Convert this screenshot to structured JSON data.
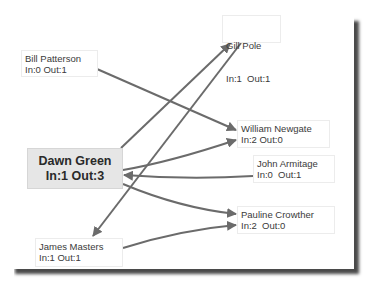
{
  "diagram": {
    "type": "directed-graph",
    "edge_color": "#6b6b6b",
    "focus_fill": "#e6e6e6",
    "nodes": [
      {
        "id": "bill",
        "name": "Bill Patterson",
        "stats": "In:0 Out:1"
      },
      {
        "id": "gill",
        "name": "Gill Pole",
        "stats": "In:1  Out:1"
      },
      {
        "id": "william",
        "name": "William Newgate",
        "stats": "In:2 Out:0"
      },
      {
        "id": "dawn",
        "name": "Dawn Green",
        "stats": "In:1 Out:3",
        "focus": true
      },
      {
        "id": "john",
        "name": "John Armitage",
        "stats": "In:0  Out:1"
      },
      {
        "id": "pauline",
        "name": "Pauline Crowther",
        "stats": "In:2  Out:0"
      },
      {
        "id": "james",
        "name": "James Masters",
        "stats": "In:1 Out:1"
      }
    ],
    "edges": [
      {
        "from": "dawn",
        "to": "gill"
      },
      {
        "from": "gill",
        "to": "james"
      },
      {
        "from": "bill",
        "to": "william"
      },
      {
        "from": "dawn",
        "to": "william"
      },
      {
        "from": "john",
        "to": "dawn"
      },
      {
        "from": "dawn",
        "to": "pauline"
      },
      {
        "from": "james",
        "to": "pauline"
      }
    ]
  }
}
